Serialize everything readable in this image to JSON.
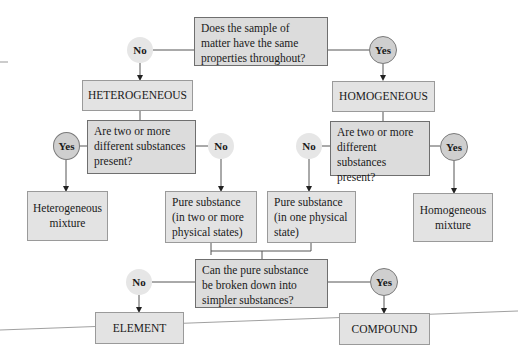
{
  "diagram": {
    "colors": {
      "box_fill": "#e3e3e3",
      "question_fill": "#dcdcdc",
      "no_circle": "#e6e6e6",
      "yes_circle": "#cfcfcf",
      "line": "#555555"
    },
    "q1": {
      "text": "Does the sample of matter have the same properties throughout?",
      "no": "No",
      "yes": "Yes"
    },
    "heterogeneous": "HETEROGENEOUS",
    "homogeneous": "HOMOGENEOUS",
    "q2_left": {
      "text": "Are two or more different substances present?",
      "yes": "Yes",
      "no": "No"
    },
    "q2_right": {
      "text": "Are two or more different substances present?",
      "no": "No",
      "yes": "Yes"
    },
    "heterogeneous_mixture": "Heterogeneous mixture",
    "pure_multi": "Pure substance (in two or more physical states)",
    "pure_single": "Pure substance (in one physical state)",
    "homogeneous_mixture": "Homogeneous mixture",
    "q3": {
      "text": "Can the pure substance be broken down into simpler substances?",
      "no": "No",
      "yes": "Yes"
    },
    "element": "ELEMENT",
    "compound": "COMPOUND"
  }
}
